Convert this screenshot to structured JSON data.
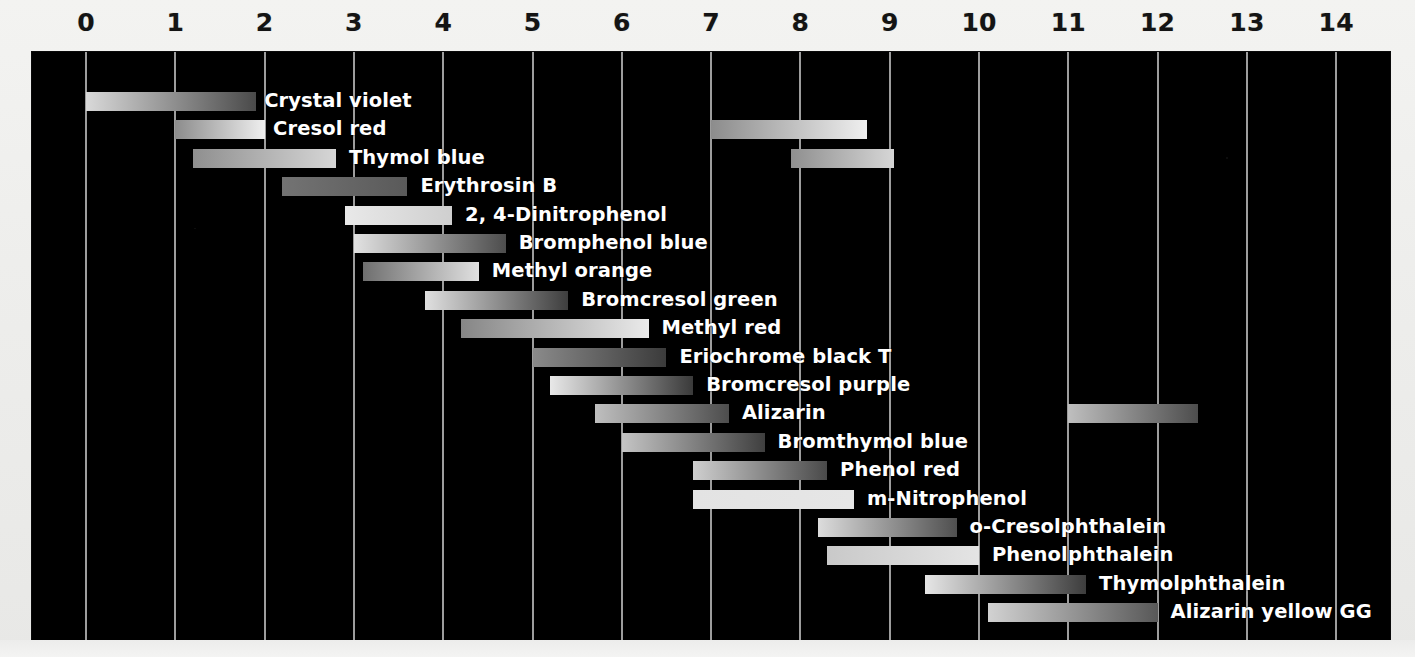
{
  "chart_data": {
    "type": "bar",
    "title": "",
    "subtitle": "",
    "xlabel": "",
    "ylabel": "",
    "orientation": "horizontal",
    "xlim": [
      0,
      14
    ],
    "grid": true,
    "legend": "none",
    "background": "#000000",
    "tick_labels": [
      "0",
      "1",
      "2",
      "3",
      "4",
      "5",
      "6",
      "7",
      "8",
      "9",
      "10",
      "11",
      "12",
      "13",
      "14"
    ],
    "tick_values": [
      0,
      1,
      2,
      3,
      4,
      5,
      6,
      7,
      8,
      9,
      10,
      11,
      12,
      13,
      14
    ],
    "categories": [
      "Crystal violet",
      "Cresol red",
      "Thymol blue",
      "Erythrosin B",
      "2, 4-Dinitrophenol",
      "Bromphenol blue",
      "Methyl orange",
      "Bromcresol green",
      "Methyl red",
      "Eriochrome black T",
      "Bromcresol purple",
      "Alizarin",
      "Bromthymol blue",
      "Phenol red",
      "m-Nitrophenol",
      "o-Cresolphthalein",
      "Phenolphthalein",
      "Thymolphthalein",
      "Alizarin yellow GG"
    ],
    "series": [
      {
        "name": "pH transition range",
        "bars": [
          {
            "label": "Crystal violet",
            "ranges": [
              {
                "start": 0.0,
                "end": 1.9
              }
            ],
            "color_start": "#d9d9d9",
            "color_end": "#4a4a4a",
            "label_x": 1.95
          },
          {
            "label": "Cresol red",
            "ranges": [
              {
                "start": 1.0,
                "end": 2.0
              },
              {
                "start": 7.0,
                "end": 8.75
              }
            ],
            "color_start": "#8c8c8c",
            "color_end": "#efefef",
            "label_x": 2.05
          },
          {
            "label": "Thymol blue",
            "ranges": [
              {
                "start": 1.2,
                "end": 2.8
              },
              {
                "start": 7.9,
                "end": 9.05
              }
            ],
            "color_start": "#8f8f8f",
            "color_end": "#d6d6d6",
            "label_x": 2.9
          },
          {
            "label": "Erythrosin B",
            "ranges": [
              {
                "start": 2.2,
                "end": 3.6
              }
            ],
            "color_start": "#737373",
            "color_end": "#5a5a5a",
            "label_x": 3.7
          },
          {
            "label": "2, 4-Dinitrophenol",
            "ranges": [
              {
                "start": 2.9,
                "end": 4.1
              }
            ],
            "color_start": "#e9e9e9",
            "color_end": "#cfcfcf",
            "label_x": 4.2
          },
          {
            "label": "Bromphenol blue",
            "ranges": [
              {
                "start": 3.0,
                "end": 4.7
              }
            ],
            "color_start": "#e2e2e2",
            "color_end": "#4d4d4d",
            "label_x": 4.8
          },
          {
            "label": "Methyl orange",
            "ranges": [
              {
                "start": 3.1,
                "end": 4.4
              }
            ],
            "color_start": "#6f6f6f",
            "color_end": "#e0e0e0",
            "label_x": 4.5
          },
          {
            "label": "Bromcresol green",
            "ranges": [
              {
                "start": 3.8,
                "end": 5.4
              }
            ],
            "color_start": "#e0e0e0",
            "color_end": "#3e3e3e",
            "label_x": 5.5
          },
          {
            "label": "Methyl red",
            "ranges": [
              {
                "start": 4.2,
                "end": 6.3
              }
            ],
            "color_start": "#868686",
            "color_end": "#eaeaea",
            "label_x": 6.4
          },
          {
            "label": "Eriochrome black T",
            "ranges": [
              {
                "start": 5.0,
                "end": 6.5
              }
            ],
            "color_start": "#8a8a8a",
            "color_end": "#3b3b3b",
            "label_x": 6.6
          },
          {
            "label": "Bromcresol purple",
            "ranges": [
              {
                "start": 5.2,
                "end": 6.8
              }
            ],
            "color_start": "#e8e8e8",
            "color_end": "#3a3a3a",
            "label_x": 6.9
          },
          {
            "label": "Alizarin",
            "ranges": [
              {
                "start": 5.7,
                "end": 7.2
              },
              {
                "start": 11.0,
                "end": 12.45
              }
            ],
            "color_start": "#bfbfbf",
            "color_end": "#4d4d4d",
            "label_x": 7.3
          },
          {
            "label": "Bromthymol blue",
            "ranges": [
              {
                "start": 6.0,
                "end": 7.6
              }
            ],
            "color_start": "#c4c4c4",
            "color_end": "#3f3f3f",
            "label_x": 7.7
          },
          {
            "label": "Phenol red",
            "ranges": [
              {
                "start": 6.8,
                "end": 8.3
              }
            ],
            "color_start": "#cfcfcf",
            "color_end": "#4a4a4a",
            "label_x": 8.4
          },
          {
            "label": "m-Nitrophenol",
            "ranges": [
              {
                "start": 6.8,
                "end": 8.6
              }
            ],
            "color_start": "#e3e3e3",
            "color_end": "#e6e6e6",
            "label_x": 8.7
          },
          {
            "label": "o-Cresolphthalein",
            "ranges": [
              {
                "start": 8.2,
                "end": 9.75
              }
            ],
            "color_start": "#dcdcdc",
            "color_end": "#4f4f4f",
            "label_x": 9.85
          },
          {
            "label": "Phenolphthalein",
            "ranges": [
              {
                "start": 8.3,
                "end": 10.0
              }
            ],
            "color_start": "#c9c9c9",
            "color_end": "#e4e4e4",
            "label_x": 10.1
          },
          {
            "label": "Thymolphthalein",
            "ranges": [
              {
                "start": 9.4,
                "end": 11.2
              }
            ],
            "color_start": "#e6e6e6",
            "color_end": "#3d3d3d",
            "label_x": 11.3
          },
          {
            "label": "Alizarin yellow GG",
            "ranges": [
              {
                "start": 10.1,
                "end": 12.0
              }
            ],
            "color_start": "#d2d2d2",
            "color_end": "#585858",
            "label_x": 12.1
          }
        ]
      }
    ]
  },
  "style": {
    "plot_background": "#000000",
    "page_background": "#efefed",
    "gridline_color": "#b9b9b9",
    "label_color": "#ffffff",
    "tick_color": "#141414"
  }
}
